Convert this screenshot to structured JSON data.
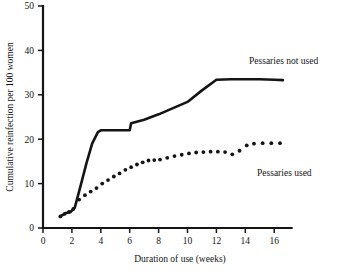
{
  "chart_data": {
    "type": "line",
    "title": "",
    "xlabel": "Duration of use (weeks)",
    "ylabel": "Cumulative reinfection per 100 women",
    "xlim": [
      0,
      17.2
    ],
    "ylim": [
      0,
      50
    ],
    "xticks": [
      0,
      2,
      4,
      6,
      8,
      10,
      12,
      14,
      16
    ],
    "xtick_labels": [
      "0",
      "2",
      "4",
      "6",
      "8",
      "10",
      "12",
      "14",
      "16"
    ],
    "yticks": [
      0,
      10,
      20,
      30,
      40,
      50
    ],
    "ytick_labels": [
      "0",
      "10",
      "20",
      "30",
      "40",
      "50"
    ],
    "grid": false,
    "legend_position": "inline-annotation",
    "series": [
      {
        "name": "Pessaries not used",
        "style": "solid",
        "label_text": "Pessaries not used",
        "x": [
          1.2,
          1.6,
          1.9,
          2.2,
          2.6,
          3.0,
          3.4,
          3.8,
          4.0,
          5.0,
          6.0,
          6.1,
          7.0,
          8.0,
          9.0,
          10.0,
          11.0,
          12.0,
          13.0,
          14.0,
          15.0,
          16.0,
          16.6
        ],
        "y": [
          2.6,
          3.4,
          3.6,
          4.6,
          9.5,
          14.5,
          19.0,
          21.6,
          22.0,
          22.0,
          22.0,
          23.6,
          24.4,
          25.6,
          27.0,
          28.4,
          31.0,
          33.4,
          33.5,
          33.5,
          33.5,
          33.4,
          33.3
        ]
      },
      {
        "name": "Pessaries used",
        "style": "dotted",
        "label_text": "Pessaries used",
        "x": [
          1.2,
          1.5,
          1.8,
          2.1,
          2.5,
          2.9,
          3.3,
          3.7,
          4.1,
          4.5,
          4.9,
          5.3,
          5.7,
          6.1,
          6.5,
          6.9,
          7.3,
          7.7,
          8.1,
          8.6,
          9.1,
          9.6,
          10.1,
          10.6,
          11.1,
          11.6,
          12.1,
          12.6,
          13.1,
          13.6,
          14.1,
          14.6,
          15.2,
          15.8,
          16.4
        ],
        "y": [
          2.6,
          3.2,
          3.6,
          4.3,
          6.4,
          7.4,
          8.2,
          9.0,
          10.0,
          10.8,
          11.6,
          12.3,
          13.1,
          13.7,
          14.3,
          14.8,
          15.2,
          15.3,
          15.4,
          15.8,
          16.2,
          16.5,
          16.8,
          17.0,
          17.1,
          17.2,
          17.2,
          17.1,
          16.6,
          17.4,
          18.6,
          19.0,
          19.1,
          19.1,
          19.1
        ]
      }
    ]
  }
}
